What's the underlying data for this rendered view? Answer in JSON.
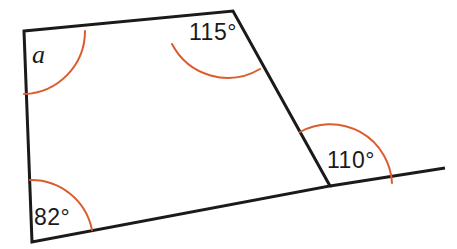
{
  "figure": {
    "name": "quadrilateral-with-exterior-angle",
    "canvas": {
      "width": 457,
      "height": 249
    },
    "colors": {
      "outline": "#1a1a1a",
      "arc": "#DD5C2E",
      "label": "#1a1a1a",
      "background": "#ffffff"
    },
    "stroke_width": 3,
    "arc_stroke_width": 2,
    "vertices": {
      "top_left": {
        "x": 24,
        "y": 31
      },
      "top_right": {
        "x": 233,
        "y": 11
      },
      "bottom_right": {
        "x": 330,
        "y": 186
      },
      "bottom_left": {
        "x": 32,
        "y": 242
      },
      "ray_end": {
        "x": 445,
        "y": 168
      }
    },
    "shape_path": "M 24 31 L 233 11 L 330 186 L 32 242 Z",
    "extension_path": "M 330 186 L 445 168",
    "arcs": [
      {
        "name": "angle-arc-top-left",
        "path": "M 24 94 A 63 63 0 0 0 85 31",
        "label_ref": "top_left"
      },
      {
        "name": "angle-arc-top-right",
        "path": "M 172 44 A 63 63 0 0 0 260 69",
        "label_ref": "top_right"
      },
      {
        "name": "angle-arc-bottom-right",
        "path": "M 300 132 A 62 62 0 0 1 392 183",
        "label_ref": "bottom_right"
      },
      {
        "name": "angle-arc-bottom-left",
        "path": "M 30 180 A 62 62 0 0 1 92 230",
        "label_ref": "bottom_left"
      }
    ],
    "labels": {
      "unknown_angle": "a",
      "top_right_angle": "115°",
      "exterior_angle": "110°",
      "bottom_left_angle": "82°"
    }
  }
}
